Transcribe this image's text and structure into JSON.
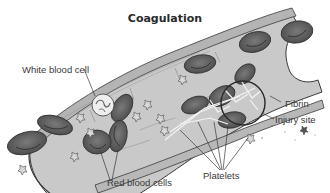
{
  "diagram": {
    "title": "Coagulation",
    "labels": {
      "white_blood_cell": "White blood cell",
      "fibrin": "Fibrin",
      "injury_site": "Injury site",
      "platelets": "Platelets",
      "red_blood_cells": "Red blood cells"
    },
    "colors": {
      "vessel_wall": "#bdbdbd",
      "vessel_interior": "#c9c9c9",
      "red_blood_cell": "#5c5c5c",
      "outline": "#3a3a3a",
      "fibrin": "#f2f2f2",
      "background": "#ffffff"
    }
  }
}
